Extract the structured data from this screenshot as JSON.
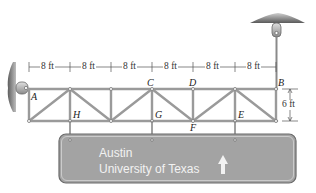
{
  "figure": {
    "type": "truss-diagram",
    "colors": {
      "member": "#9a9a9a",
      "member_outline": "#6f6f6f",
      "sign_fill": "#a3a3a3",
      "sign_border": "#6a6a6a",
      "sign_text": "#f2f2f2",
      "support": "#8a8a8a",
      "label": "#222222"
    }
  },
  "dimensions": {
    "panels": [
      "8 ft",
      "8 ft",
      "8 ft",
      "8 ft",
      "8 ft",
      "8 ft"
    ],
    "height": "6 ft"
  },
  "nodes": {
    "A": "A",
    "B": "B",
    "C": "C",
    "D": "D",
    "E": "E",
    "F": "F",
    "G": "G",
    "H": "H"
  },
  "sign": {
    "line1": "Austin",
    "line2": "University of Texas",
    "arrow": "up-arrow"
  }
}
